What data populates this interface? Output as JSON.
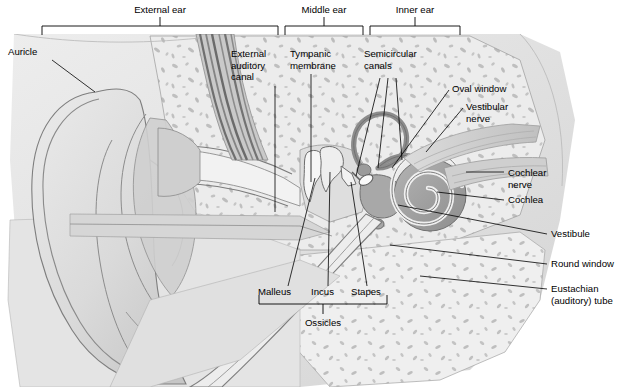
{
  "figure": {
    "type": "anatomical-diagram",
    "palette": {
      "background": "#ffffff",
      "skin_light": "#e6e6e6",
      "skin_mid": "#d2d2d2",
      "bone_light": "#ebebeb",
      "bone_speck": "#b6b6b6",
      "cartilage_dark": "#8f8f8f",
      "canal_stripe": "#7d7d7d",
      "inner_dark": "#9a9a9a",
      "outline": "#5a5a5a",
      "leader_line": "#000000",
      "text": "#000000"
    }
  },
  "region_brackets": [
    {
      "id": "external-ear",
      "label": "External ear",
      "x1": 42,
      "x2": 278,
      "tick_x": 160,
      "label_x": 160,
      "label_y": 13,
      "bar_y": 26
    },
    {
      "id": "middle-ear",
      "label": "Middle ear",
      "x1": 285,
      "x2": 363,
      "tick_x": 324,
      "label_x": 324,
      "label_y": 13,
      "bar_y": 26
    },
    {
      "id": "inner-ear",
      "label": "Inner ear",
      "x1": 370,
      "x2": 460,
      "tick_x": 415,
      "label_x": 415,
      "label_y": 13,
      "bar_y": 26
    }
  ],
  "callouts": [
    {
      "id": "auricle",
      "lines": [
        "Auricle"
      ],
      "label_x": 8,
      "label_y": 55,
      "anchor": "start",
      "leader": "M 52 60 L 95 92"
    },
    {
      "id": "external-auditory-canal",
      "lines": [
        "External",
        "auditory",
        "canal"
      ],
      "label_x": 231,
      "label_y": 57,
      "anchor": "start",
      "leader": "M 275 86 L 275 212"
    },
    {
      "id": "tympanic-membrane",
      "lines": [
        "Tympanic",
        "membrane"
      ],
      "label_x": 290,
      "label_y": 57,
      "anchor": "start",
      "leader": "M 311 74 L 311 182"
    },
    {
      "id": "semicircular-canals",
      "lines": [
        "Semicircular",
        "canals"
      ],
      "label_x": 364,
      "label_y": 57,
      "anchor": "start",
      "leader": "M 380 78 L 356 176 M 388 78 L 378 168 M 396 78 L 402 160"
    },
    {
      "id": "oval-window",
      "lines": [
        "Oval window"
      ],
      "label_x": 452,
      "label_y": 92,
      "anchor": "start",
      "leader": "M 449 90 L 392 168"
    },
    {
      "id": "vestibular-nerve",
      "lines": [
        "Vestibular",
        "nerve"
      ],
      "label_x": 466,
      "label_y": 110,
      "anchor": "start",
      "leader": "M 463 108 L 426 152"
    },
    {
      "id": "cochlear-nerve",
      "lines": [
        "Cochlear",
        "nerve"
      ],
      "label_x": 508,
      "label_y": 176,
      "anchor": "start",
      "leader": "M 504 172 L 466 172"
    },
    {
      "id": "cochlea",
      "lines": [
        "Cochlea"
      ],
      "label_x": 508,
      "label_y": 203,
      "anchor": "start",
      "leader": "M 504 200 L 437 192"
    },
    {
      "id": "vestibule",
      "lines": [
        "Vestibule"
      ],
      "label_x": 551,
      "label_y": 237,
      "anchor": "start",
      "leader": "M 547 234 L 398 205"
    },
    {
      "id": "round-window",
      "lines": [
        "Round window"
      ],
      "label_x": 551,
      "label_y": 267,
      "anchor": "start",
      "leader": "M 547 264 L 390 245"
    },
    {
      "id": "eustachian-auditory-tube",
      "lines": [
        "Eustachian",
        "(auditory) tube"
      ],
      "label_x": 551,
      "label_y": 292,
      "anchor": "start",
      "leader": "M 547 289 L 420 276"
    },
    {
      "id": "malleus",
      "lines": [
        "Malleus"
      ],
      "label_x": 258,
      "label_y": 295,
      "anchor": "start",
      "leader": "M 288 286 L 315 178"
    },
    {
      "id": "incus",
      "lines": [
        "Incus"
      ],
      "label_x": 311,
      "label_y": 295,
      "anchor": "start",
      "leader": "M 328 286 L 330 172"
    },
    {
      "id": "stapes",
      "lines": [
        "Stapes"
      ],
      "label_x": 351,
      "label_y": 295,
      "anchor": "start",
      "leader": "M 367 286 L 351 182"
    }
  ],
  "ossicles_bracket": {
    "id": "ossicles",
    "label": "Ossicles",
    "x1": 259,
    "x2": 387,
    "bar_y": 304,
    "tick_x": 323,
    "label_x": 323,
    "label_y": 326
  },
  "structures": [
    {
      "id": "auricle",
      "name": "Auricle (pinna)"
    },
    {
      "id": "external-auditory-canal",
      "name": "External auditory canal"
    },
    {
      "id": "tympanic-membrane",
      "name": "Tympanic membrane (eardrum)"
    },
    {
      "id": "malleus",
      "name": "Malleus"
    },
    {
      "id": "incus",
      "name": "Incus"
    },
    {
      "id": "stapes",
      "name": "Stapes"
    },
    {
      "id": "semicircular-canals",
      "name": "Semicircular canals"
    },
    {
      "id": "oval-window",
      "name": "Oval window"
    },
    {
      "id": "round-window",
      "name": "Round window"
    },
    {
      "id": "vestibule",
      "name": "Vestibule"
    },
    {
      "id": "vestibular-nerve",
      "name": "Vestibular nerve"
    },
    {
      "id": "cochlear-nerve",
      "name": "Cochlear nerve"
    },
    {
      "id": "cochlea",
      "name": "Cochlea"
    },
    {
      "id": "eustachian-tube",
      "name": "Eustachian (auditory) tube"
    }
  ]
}
